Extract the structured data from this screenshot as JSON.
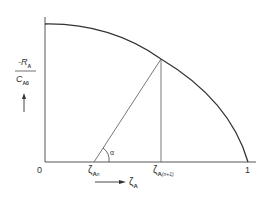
{
  "diagram": {
    "type": "conversion-rate-curve",
    "y_axis_label": {
      "numerator": "-R",
      "numerator_sub": "A",
      "denominator": "C",
      "denominator_sub": "A0"
    },
    "x_axis_label": {
      "symbol": "ζ",
      "sub": "A"
    },
    "origin_label": "0",
    "x_end_label": "1",
    "tick_labels": [
      {
        "symbol": "ζ",
        "sub": "A",
        "subsub": "n"
      },
      {
        "symbol": "ζ",
        "sub": "A",
        "subsub": "(n+1)"
      }
    ],
    "angle_label": "α",
    "colors": {
      "line": "#333333",
      "background": "#ffffff"
    }
  }
}
